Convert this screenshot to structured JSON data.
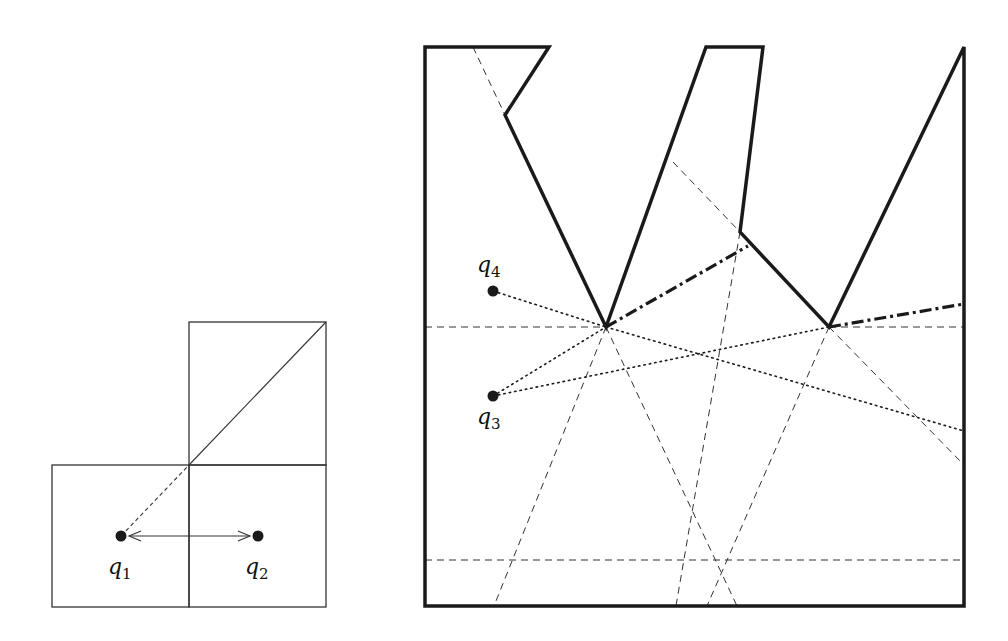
{
  "figures": {
    "left": {
      "squares": [
        {
          "x": 52,
          "y": 465,
          "w": 137,
          "h": 142
        },
        {
          "x": 189,
          "y": 322,
          "w": 137,
          "h": 143
        },
        {
          "x": 189,
          "y": 465,
          "w": 137,
          "h": 142
        }
      ],
      "diagonal_solid": {
        "x1": 189,
        "y1": 465,
        "x2": 326,
        "y2": 322
      },
      "diagonal_dashed": {
        "x1": 121,
        "y1": 536,
        "x2": 189,
        "y2": 465
      },
      "arrow": {
        "x1": 121,
        "y1": 536,
        "x2": 258,
        "y2": 536
      },
      "points": [
        {
          "id": "q1",
          "base": "q",
          "sub": "1",
          "x": 121,
          "y": 536,
          "label_x": 108,
          "label_y": 574
        },
        {
          "id": "q2",
          "base": "q",
          "sub": "2",
          "x": 258,
          "y": 536,
          "label_x": 245,
          "label_y": 574
        }
      ]
    },
    "right": {
      "polygon": "425,47 549,47 505,115 606,327 706,47 763,47 740,232 829,327 964,47 964,606 425,606",
      "dashed_lines": [
        [
          473,
          47,
          505,
          115
        ],
        [
          673,
          162,
          740,
          232
        ],
        [
          425,
          327,
          606,
          327
        ],
        [
          829,
          327,
          964,
          327
        ],
        [
          425,
          560,
          964,
          560
        ],
        [
          606,
          327,
          494,
          606
        ],
        [
          606,
          327,
          737,
          606
        ],
        [
          740,
          232,
          676,
          606
        ],
        [
          829,
          327,
          707,
          606
        ],
        [
          829,
          327,
          964,
          465
        ]
      ],
      "dotted_lines": [
        [
          493,
          291,
          606,
          327
        ],
        [
          606,
          327,
          964,
          431
        ],
        [
          493,
          396,
          606,
          327
        ],
        [
          493,
          396,
          829,
          327
        ]
      ],
      "dashdot_lines": [
        [
          606,
          327,
          748,
          246
        ],
        [
          829,
          327,
          964,
          304
        ]
      ],
      "points": [
        {
          "id": "q4",
          "base": "q",
          "sub": "4",
          "x": 493,
          "y": 291,
          "label_x": 477,
          "label_y": 272
        },
        {
          "id": "q3",
          "base": "q",
          "sub": "3",
          "x": 493,
          "y": 396,
          "label_x": 477,
          "label_y": 424
        }
      ]
    }
  },
  "colors": {
    "stroke": "#1a1a1a",
    "thin": "#333333"
  }
}
